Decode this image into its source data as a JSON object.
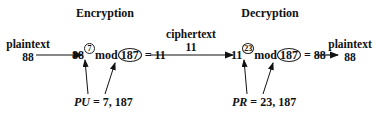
{
  "encryption": {
    "title": "Encryption",
    "base": "88",
    "exponent": "7",
    "mod_label": "mod",
    "modulus": "187",
    "result": "= 11",
    "key_name": "PU",
    "key_value": " = 7, 187"
  },
  "decryption": {
    "title": "Decryption",
    "base": "11",
    "exponent": "23",
    "mod_label": "mod",
    "modulus": "187",
    "result": "= 88",
    "key_name": "PR",
    "key_value": " = 23, 187"
  },
  "input": {
    "label": "plaintext",
    "value": "88"
  },
  "middle": {
    "label": "ciphertext",
    "value": "11"
  },
  "output": {
    "label": "plaintext",
    "value": "88"
  },
  "colors": {
    "box_fill": "#bdbdbd",
    "box_border": "#555555",
    "line": "#111111"
  }
}
